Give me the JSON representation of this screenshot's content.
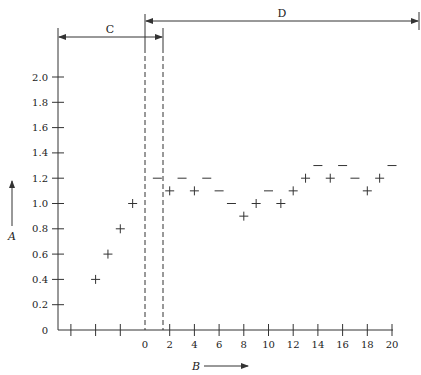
{
  "chart_data": {
    "type": "scatter",
    "title": "",
    "xlabel": "B",
    "ylabel": "A",
    "xlim": [
      -5,
      20
    ],
    "ylim": [
      0,
      2.0
    ],
    "grid": false,
    "x_tick_labels": [
      "0",
      "2",
      "4",
      "6",
      "8",
      "10",
      "12",
      "14",
      "16",
      "18",
      "20"
    ],
    "x_ticks_unlabeled": [
      -4,
      -2
    ],
    "y_tick_labels": [
      "0",
      "0.2",
      "0.4",
      "0.6",
      "0.8",
      "1.0",
      "1.2",
      "1.4",
      "1.6",
      "1.8",
      "2.0"
    ],
    "regions": [
      {
        "label": "C",
        "x_start": -7,
        "x_end": 1.5
      },
      {
        "label": "D",
        "x_start": 0,
        "x_end": 22.1
      }
    ],
    "vertical_dashed_lines": [
      0,
      1.5
    ],
    "series": [
      {
        "name": "plus",
        "marker": "+",
        "points": [
          {
            "x": -4,
            "y": 0.4
          },
          {
            "x": -3,
            "y": 0.6
          },
          {
            "x": -2,
            "y": 0.8
          },
          {
            "x": -1,
            "y": 1.0
          },
          {
            "x": 2,
            "y": 1.1
          },
          {
            "x": 4,
            "y": 1.1
          },
          {
            "x": 8,
            "y": 0.9
          },
          {
            "x": 9,
            "y": 1.0
          },
          {
            "x": 11,
            "y": 1.0
          },
          {
            "x": 12,
            "y": 1.1
          },
          {
            "x": 13,
            "y": 1.2
          },
          {
            "x": 15,
            "y": 1.2
          },
          {
            "x": 18,
            "y": 1.1
          },
          {
            "x": 19,
            "y": 1.2
          }
        ]
      },
      {
        "name": "dash",
        "marker": "-",
        "points": [
          {
            "x": 1,
            "y": 1.2
          },
          {
            "x": 3,
            "y": 1.2
          },
          {
            "x": 5,
            "y": 1.2
          },
          {
            "x": 6,
            "y": 1.1
          },
          {
            "x": 7,
            "y": 1.0
          },
          {
            "x": 10,
            "y": 1.1
          },
          {
            "x": 14,
            "y": 1.3
          },
          {
            "x": 16,
            "y": 1.3
          },
          {
            "x": 17,
            "y": 1.2
          },
          {
            "x": 20,
            "y": 1.3
          }
        ]
      }
    ]
  },
  "labels": {
    "region_c": "C",
    "region_d": "D",
    "axis_a": "A",
    "axis_b": "B"
  },
  "colors": {
    "ink": "#333333",
    "background": "#ffffff"
  }
}
